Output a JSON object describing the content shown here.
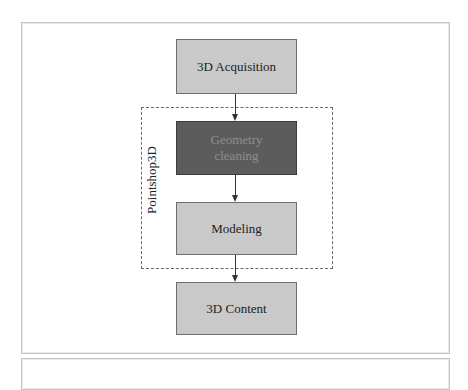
{
  "diagram": {
    "type": "flowchart",
    "nodes": [
      {
        "id": "acquisition",
        "label": "3D Acquisition",
        "style": "light"
      },
      {
        "id": "geometry_cleaning",
        "label": "Geometry cleaning",
        "lines": [
          "Geometry",
          "cleaning"
        ],
        "style": "dark"
      },
      {
        "id": "modeling",
        "label": "Modeling",
        "style": "light"
      },
      {
        "id": "content",
        "label": "3D Content",
        "style": "light"
      }
    ],
    "edges": [
      {
        "from": "acquisition",
        "to": "geometry_cleaning"
      },
      {
        "from": "geometry_cleaning",
        "to": "modeling"
      },
      {
        "from": "modeling",
        "to": "content"
      }
    ],
    "group": {
      "label": "Pointshop3D",
      "contains": [
        "geometry_cleaning",
        "modeling"
      ]
    },
    "colors": {
      "light_box": "#c9c9c9",
      "dark_box": "#5c5c5c",
      "dark_text": "#8e8e8e",
      "border": "#6e6e6e",
      "dashed": "#6a6a6a"
    }
  }
}
